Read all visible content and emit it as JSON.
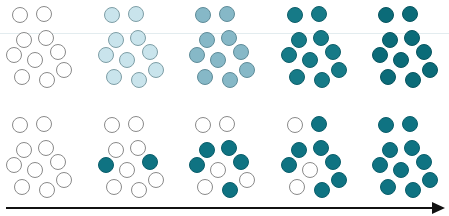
{
  "diagram": {
    "colors": {
      "empty_fill": "#ffffff",
      "empty_stroke": "#8a8a8a",
      "filled": "#0f7382",
      "filled_stroke": "#0a5e6b",
      "arrow": "#111111",
      "guide_line": "#e3ecef"
    },
    "circle_positions": [
      [
        10,
        7
      ],
      [
        34,
        6
      ],
      [
        14,
        32
      ],
      [
        36,
        30
      ],
      [
        4,
        47
      ],
      [
        25,
        52
      ],
      [
        48,
        44
      ],
      [
        12,
        69
      ],
      [
        37,
        72
      ],
      [
        54,
        62
      ]
    ],
    "top_row": {
      "label": "gradual uniform shading",
      "y": 0,
      "clusters": [
        {
          "x": 2,
          "fill": "#ffffff",
          "stroke": "#8a8a8a"
        },
        {
          "x": 94,
          "fill": "#c9e4ec",
          "stroke": "#7e9ea6"
        },
        {
          "x": 185,
          "fill": "#86b8c7",
          "stroke": "#5f8c99"
        },
        {
          "x": 277,
          "fill": "#167a87",
          "stroke": "#0f5f6a"
        },
        {
          "x": 368,
          "fill": "#0b6b78",
          "stroke": "#085560"
        }
      ]
    },
    "bottom_row": {
      "label": "discrete individual filling",
      "y": 110,
      "clusters": [
        {
          "x": 2,
          "filled_indices": []
        },
        {
          "x": 94,
          "filled_indices": [
            4,
            6
          ]
        },
        {
          "x": 185,
          "filled_indices": [
            2,
            3,
            4,
            6,
            8
          ]
        },
        {
          "x": 277,
          "filled_indices": [
            1,
            2,
            3,
            4,
            6,
            8,
            9
          ]
        },
        {
          "x": 368,
          "filled_indices": [
            0,
            1,
            2,
            3,
            4,
            5,
            6,
            7,
            8,
            9
          ]
        }
      ]
    },
    "arrow": {
      "direction": "right",
      "meaning": "progression"
    }
  }
}
